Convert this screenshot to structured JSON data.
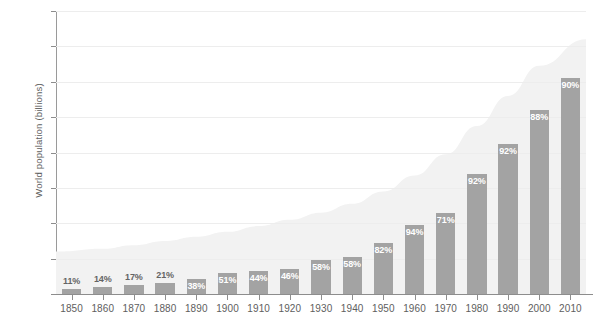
{
  "chart_data": {
    "type": "bar",
    "title": "",
    "subtitle": "",
    "xlabel": "",
    "ylabel": "World population (billions)",
    "ylim": [
      0,
      8
    ],
    "ytick_labels": [
      "0",
      "1",
      "2",
      "3",
      "4",
      "5",
      "6",
      "7",
      "8"
    ],
    "ytick_values": [
      0,
      1,
      2,
      3,
      4,
      5,
      6,
      7,
      8
    ],
    "grid": true,
    "legend": "none",
    "categories": [
      "1850",
      "1860",
      "1870",
      "1880",
      "1890",
      "1900",
      "1910",
      "1920",
      "1930",
      "1940",
      "1950",
      "1960",
      "1970",
      "1980",
      "1990",
      "2000",
      "2010"
    ],
    "series": [
      {
        "name": "Population covered (billions)",
        "values": [
          0.15,
          0.2,
          0.25,
          0.32,
          0.42,
          0.6,
          0.65,
          0.72,
          0.95,
          1.05,
          1.45,
          1.95,
          2.3,
          3.4,
          4.25,
          5.2,
          6.1
        ],
        "data_labels": [
          "11%",
          "14%",
          "17%",
          "21%",
          "38%",
          "51%",
          "44%",
          "46%",
          "58%",
          "58%",
          "82%",
          "94%",
          "71%",
          "92%",
          "92%",
          "88%",
          "90%"
        ],
        "label_position": [
          "outside",
          "outside",
          "outside",
          "outside",
          "inside",
          "inside",
          "inside",
          "inside",
          "inside",
          "inside",
          "inside",
          "inside",
          "inside",
          "inside",
          "inside",
          "inside",
          "inside"
        ],
        "color": "#a3a3a3"
      },
      {
        "name": "Total world population (billions)",
        "type": "area",
        "values": [
          1.2,
          1.28,
          1.38,
          1.5,
          1.62,
          1.76,
          1.92,
          2.1,
          2.3,
          2.55,
          2.9,
          3.35,
          3.95,
          4.75,
          5.6,
          6.45,
          7.2
        ],
        "color": "#f2f2f2"
      }
    ]
  }
}
